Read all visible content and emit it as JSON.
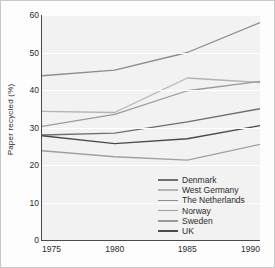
{
  "chart_data": {
    "type": "line",
    "title": "",
    "xlabel": "",
    "ylabel": "Paper recycled (%)",
    "x": [
      1975,
      1980,
      1985,
      1990
    ],
    "xtick_labels": [
      "1975",
      "1980",
      "1985",
      "1990"
    ],
    "ytick_labels": [
      "0",
      "10",
      "20",
      "30",
      "40",
      "50",
      "60"
    ],
    "ytick_values": [
      0,
      10,
      20,
      30,
      40,
      50,
      60
    ],
    "ylim": [
      0,
      60
    ],
    "xlim": [
      1975,
      1990
    ],
    "grid": true,
    "grid_color": "#ffffff",
    "plot_background": "#f2f2f2",
    "legend_position": "lower right",
    "series": [
      {
        "name": "Denmark",
        "color": "#6e6e6e",
        "values": [
          28.0,
          28.5,
          31.5,
          35.0
        ]
      },
      {
        "name": "West Germany",
        "color": "#b4b4b4",
        "values": [
          34.3,
          34.0,
          43.2,
          42.0
        ]
      },
      {
        "name": "The Netherlands",
        "color": "#8c8c8c",
        "values": [
          43.8,
          45.3,
          50.0,
          58.0
        ]
      },
      {
        "name": "Norway",
        "color": "#a0a0a0",
        "values": [
          23.8,
          22.2,
          21.3,
          25.5
        ]
      },
      {
        "name": "Sweden",
        "color": "#9a9a9a",
        "values": [
          30.3,
          33.5,
          39.8,
          42.3
        ]
      },
      {
        "name": "UK",
        "color": "#4a4a4a",
        "values": [
          27.8,
          25.7,
          27.0,
          30.5
        ]
      }
    ]
  }
}
